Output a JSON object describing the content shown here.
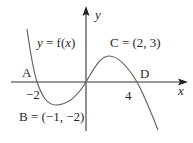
{
  "diagram": {
    "type": "function-graph",
    "curve_label": "y = f(x)",
    "curve_label_parts": {
      "prefix": "y",
      "equals": " = f(",
      "var": "x",
      "suffix": ")"
    },
    "axes": {
      "x_label": "x",
      "y_label": "y"
    },
    "points": [
      {
        "id": "A",
        "label": "A",
        "tick_label": "−2",
        "x": -2,
        "y": 0
      },
      {
        "id": "B",
        "label": "B = (−1, −2)",
        "x": -1,
        "y": -2
      },
      {
        "id": "C",
        "label": "C = (2, 3)",
        "x": 2,
        "y": 3
      },
      {
        "id": "D",
        "label": "D",
        "tick_label": "4",
        "x": 4,
        "y": 0
      }
    ],
    "colors": {
      "axis": "#333333",
      "curve": "#666666",
      "text": "#2a2a2a"
    }
  }
}
